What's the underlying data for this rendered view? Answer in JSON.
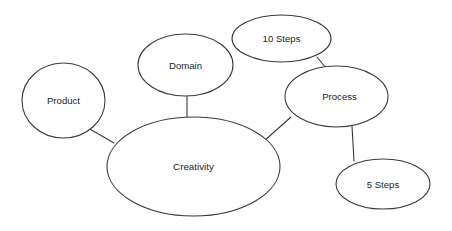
{
  "diagram": {
    "background_color": "#ffffff",
    "stroke_color": "#3a3a3a",
    "text_color": "#232323",
    "nodes": [
      {
        "id": "product",
        "label": "Product",
        "shape": "circle",
        "cx": 63.5,
        "cy": 100.5,
        "rx": 41.5,
        "ry": 37.5
      },
      {
        "id": "domain",
        "label": "Domain",
        "shape": "ellipse",
        "cx": 185.5,
        "cy": 65.0,
        "rx": 47.5,
        "ry": 31.0
      },
      {
        "id": "ten_steps",
        "label": "10 Steps",
        "shape": "ellipse",
        "cx": 281.5,
        "cy": 38.5,
        "rx": 49.5,
        "ry": 23.5
      },
      {
        "id": "process",
        "label": "Process",
        "shape": "ellipse",
        "cx": 336.5,
        "cy": 96.5,
        "rx": 51.5,
        "ry": 30.5
      },
      {
        "id": "five_steps",
        "label": "5 Steps",
        "shape": "ellipse",
        "cx": 383.0,
        "cy": 184.0,
        "rx": 47.0,
        "ry": 25.0
      },
      {
        "id": "creativity",
        "label": "Creativity",
        "shape": "ellipse",
        "cx": 193.5,
        "cy": 166.5,
        "rx": 86.5,
        "ry": 49.5
      }
    ],
    "edges": [
      {
        "id": "product-creativity",
        "from": "product",
        "to": "creativity",
        "x1": 88,
        "y1": 128,
        "x2": 114,
        "y2": 143
      },
      {
        "id": "domain-creativity",
        "from": "domain",
        "to": "creativity",
        "x1": 187,
        "y1": 96,
        "x2": 187,
        "y2": 119
      },
      {
        "id": "creativity-process",
        "from": "creativity",
        "to": "process",
        "x1": 264,
        "y1": 141,
        "x2": 291,
        "y2": 117
      },
      {
        "id": "tensteps-process",
        "from": "ten_steps",
        "to": "process",
        "x1": 317,
        "y1": 57,
        "x2": 326,
        "y2": 68
      },
      {
        "id": "process-fivesteps",
        "from": "process",
        "to": "five_steps",
        "x1": 352,
        "y1": 126,
        "x2": 354,
        "y2": 161
      }
    ]
  }
}
